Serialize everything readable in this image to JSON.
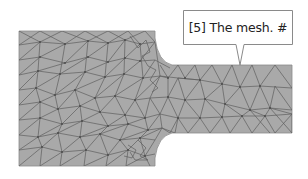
{
  "callout": {
    "label": "[5] The mesh.  #"
  },
  "colors": {
    "mesh_fill": "#a9a9a9",
    "mesh_edge": "#5e5e5e",
    "callout_border": "#8a8a8a",
    "callout_fill": "#ffffff",
    "text": "#222222"
  },
  "shape": {
    "left_block": {
      "x": 19,
      "y": 31,
      "w": 136,
      "h": 135
    },
    "right_block": {
      "x": 155,
      "y": 65,
      "w": 137,
      "h": 68
    }
  }
}
